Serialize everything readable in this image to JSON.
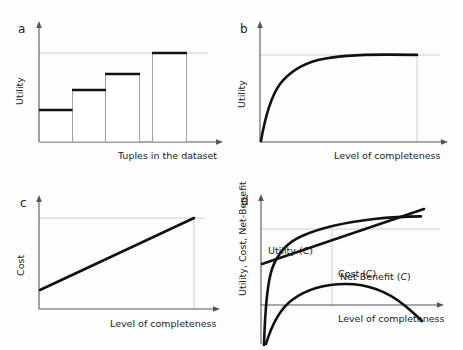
{
  "figure": {
    "background": "#fdfdfd",
    "ink": "#111111",
    "guide_color": "#c9c9c9",
    "axis_color": "#555555"
  },
  "chart_data": [
    {
      "id": "a",
      "panel_letter": "a",
      "type": "bar",
      "title": "",
      "xlabel": "Tuples in the dataset",
      "ylabel": "Utility",
      "categories": [
        "1",
        "2",
        "3",
        "4"
      ],
      "values": [
        0.3,
        0.5,
        0.66,
        0.88
      ],
      "ylim": [
        0,
        1
      ],
      "grid": false,
      "asymptote": 0.88,
      "note": "Step-wise increasing utility bars; thin grey outlines with thick black tops; faint grey horizontal guide at the top bar level."
    },
    {
      "id": "b",
      "panel_letter": "b",
      "type": "line",
      "title": "",
      "xlabel": "Level of completeness",
      "ylabel": "Utility",
      "x": [
        0,
        0.04,
        0.08,
        0.13,
        0.19,
        0.26,
        0.34,
        0.43,
        0.53,
        0.64,
        0.76,
        0.88,
        1.0
      ],
      "y": [
        0,
        0.24,
        0.37,
        0.48,
        0.58,
        0.67,
        0.75,
        0.82,
        0.88,
        0.92,
        0.95,
        0.97,
        0.975
      ],
      "xlim": [
        0,
        1
      ],
      "ylim": [
        0,
        1
      ],
      "grid": false,
      "asymptote": 0.975,
      "note": "Concave saturating utility curve rising steeply then flattening to an asymptote."
    },
    {
      "id": "c",
      "panel_letter": "c",
      "type": "line",
      "title": "",
      "xlabel": "Level of completeness",
      "ylabel": "Cost",
      "x": [
        0,
        1
      ],
      "y": [
        0.13,
        0.8
      ],
      "xlim": [
        0,
        1
      ],
      "ylim": [
        0,
        1
      ],
      "grid": false,
      "asymptote": 0.8,
      "note": "Linear increasing cost with positive intercept."
    },
    {
      "id": "d",
      "panel_letter": "d",
      "type": "line",
      "title": "",
      "xlabel": "Level of completeness",
      "ylabel": "Utility, Cost, Net-Benefit",
      "xlim": [
        0,
        1
      ],
      "ylim": [
        -0.35,
        1
      ],
      "grid": false,
      "zero_line": 0,
      "series": [
        {
          "name": "Utility (C)",
          "label_base": "Utility",
          "label_arg": "C",
          "x": [
            0.02,
            0.05,
            0.09,
            0.14,
            0.21,
            0.29,
            0.38,
            0.48,
            0.59,
            0.7,
            0.82,
            0.94,
            1.0
          ],
          "y": [
            -0.33,
            0.05,
            0.26,
            0.4,
            0.52,
            0.61,
            0.68,
            0.73,
            0.77,
            0.8,
            0.815,
            0.82,
            0.82
          ]
        },
        {
          "name": "Cost (C)",
          "label_base": "Cost",
          "label_arg": "C",
          "x": [
            0.0,
            1.0
          ],
          "y": [
            0.3,
            0.93
          ]
        },
        {
          "name": "Net Benefit (C)",
          "label_base": "Net Benefit",
          "label_arg": "C",
          "x": [
            0.03,
            0.1,
            0.18,
            0.28,
            0.4,
            0.52,
            0.64,
            0.76,
            0.88,
            1.0
          ],
          "y": [
            -0.32,
            -0.09,
            0.04,
            0.12,
            0.155,
            0.155,
            0.12,
            0.06,
            -0.04,
            -0.16
          ]
        }
      ],
      "note": "Utility saturates, Cost rises linearly and overtakes Utility near the right edge; Net Benefit is an inverted-U crossing zero twice."
    }
  ]
}
